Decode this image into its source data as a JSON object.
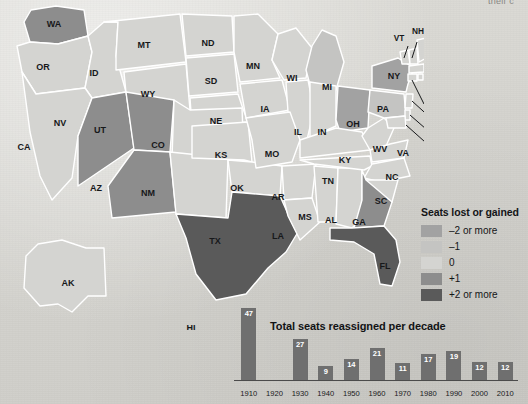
{
  "page": {
    "top_cut_text": "their c"
  },
  "map": {
    "title": "US states congressional seat change map",
    "states": [
      {
        "code": "WA",
        "value": 1
      },
      {
        "code": "OR",
        "value": 0
      },
      {
        "code": "ID",
        "value": 0
      },
      {
        "code": "MT",
        "value": 0
      },
      {
        "code": "WY",
        "value": 0
      },
      {
        "code": "ND",
        "value": 0
      },
      {
        "code": "SD",
        "value": 0
      },
      {
        "code": "MN",
        "value": 0
      },
      {
        "code": "WI",
        "value": 0
      },
      {
        "code": "MI",
        "value": -1
      },
      {
        "code": "NV",
        "value": 1
      },
      {
        "code": "UT",
        "value": 1
      },
      {
        "code": "CO",
        "value": 0
      },
      {
        "code": "NE",
        "value": 0
      },
      {
        "code": "IA",
        "value": 0
      },
      {
        "code": "IL",
        "value": 0
      },
      {
        "code": "IN",
        "value": 0
      },
      {
        "code": "OH",
        "value": -2
      },
      {
        "code": "CA",
        "value": 0
      },
      {
        "code": "AZ",
        "value": 1
      },
      {
        "code": "NM",
        "value": 0
      },
      {
        "code": "KS",
        "value": 0
      },
      {
        "code": "MO",
        "value": 0
      },
      {
        "code": "KY",
        "value": 0
      },
      {
        "code": "WV",
        "value": 0
      },
      {
        "code": "VA",
        "value": 0
      },
      {
        "code": "OK",
        "value": 0
      },
      {
        "code": "AR",
        "value": 0
      },
      {
        "code": "TN",
        "value": 0
      },
      {
        "code": "NC",
        "value": 0
      },
      {
        "code": "SC",
        "value": 0
      },
      {
        "code": "GA",
        "value": 1
      },
      {
        "code": "MS",
        "value": 0
      },
      {
        "code": "AL",
        "value": 0
      },
      {
        "code": "LA",
        "value": 0
      },
      {
        "code": "TX",
        "value": 2
      },
      {
        "code": "FL",
        "value": 2
      },
      {
        "code": "AK",
        "value": 0
      },
      {
        "code": "HI",
        "value": 0
      },
      {
        "code": "NY",
        "value": -2
      },
      {
        "code": "PA",
        "value": -1
      },
      {
        "code": "VT",
        "value": 0
      },
      {
        "code": "NH",
        "value": 0
      },
      {
        "code": "ME",
        "value": 0
      },
      {
        "code": "MA",
        "value": 0
      },
      {
        "code": "RI",
        "value": 0
      },
      {
        "code": "CT",
        "value": 0
      },
      {
        "code": "NJ",
        "value": 0
      },
      {
        "code": "DE",
        "value": 0
      },
      {
        "code": "MD",
        "value": 0
      }
    ]
  },
  "legend": {
    "title": "Seats lost or gained",
    "items": [
      {
        "label": "–2 or more",
        "color": "#a2a2a2",
        "value": -2
      },
      {
        "label": "–1",
        "color": "#c4c4c2",
        "value": -1
      },
      {
        "label": "0",
        "color": "#d4d4d1",
        "value": 0
      },
      {
        "label": "+1",
        "color": "#8d8d8d",
        "value": 1
      },
      {
        "label": "+2 or more",
        "color": "#5a5a5a",
        "value": 2
      }
    ]
  },
  "chart_data": {
    "type": "bar",
    "title": "Total seats reassigned per decade",
    "xlabel": "",
    "ylabel": "",
    "ylim": [
      0,
      47
    ],
    "grid": false,
    "legend": "none",
    "bar_color": "#6f6f6f",
    "label_color": "#ffffff",
    "categories": [
      "1910",
      "1920",
      "1930",
      "1940",
      "1950",
      "1960",
      "1970",
      "1980",
      "1990",
      "2000",
      "2010"
    ],
    "values": [
      47,
      null,
      27,
      9,
      14,
      21,
      11,
      17,
      19,
      12,
      12
    ],
    "value_labels": [
      "47",
      "",
      "27",
      "9",
      "14",
      "21",
      "11",
      "17",
      "19",
      "12",
      "12"
    ]
  }
}
